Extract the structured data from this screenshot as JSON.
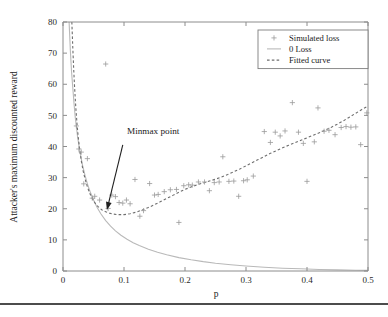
{
  "chart_data": {
    "type": "scatter",
    "title": "",
    "xlabel": "p",
    "ylabel": "Attacker's maximum discounted reward",
    "xlim": [
      0,
      0.5
    ],
    "ylim": [
      0,
      80
    ],
    "xticks": [
      "0",
      "0.1",
      "0.2",
      "0.3",
      "0.4",
      "0.5"
    ],
    "xtick_values": [
      0,
      0.1,
      0.2,
      0.3,
      0.4,
      0.5
    ],
    "yticks": [
      "0",
      "10",
      "20",
      "30",
      "40",
      "50",
      "60",
      "70",
      "80"
    ],
    "ytick_values": [
      0,
      10,
      20,
      30,
      40,
      50,
      60,
      70,
      80
    ],
    "grid": false,
    "legend_position": "top-right",
    "legend": [
      {
        "label": "Simulated loss",
        "marker": "plus",
        "style": "marker"
      },
      {
        "label": "0 Loss",
        "marker": "line",
        "style": "solid"
      },
      {
        "label": "Fitted curve",
        "marker": "line",
        "style": "dashed"
      }
    ],
    "annotations": [
      {
        "text": "Minmax point",
        "text_x": 0.105,
        "text_y": 44.0,
        "arrow_from_x": 0.098,
        "arrow_from_y": 40.5,
        "arrow_to_x": 0.072,
        "arrow_to_y": 19.6
      }
    ],
    "series": [
      {
        "name": "Simulated loss",
        "type": "scatter",
        "points": [
          [
            0.022,
            46.6
          ],
          [
            0.026,
            39.2
          ],
          [
            0.03,
            38.2
          ],
          [
            0.034,
            28.0
          ],
          [
            0.04,
            36.1
          ],
          [
            0.048,
            23.4
          ],
          [
            0.052,
            24.0
          ],
          [
            0.06,
            22.8
          ],
          [
            0.07,
            66.5
          ],
          [
            0.074,
            20.1
          ],
          [
            0.08,
            24.4
          ],
          [
            0.086,
            23.9
          ],
          [
            0.092,
            22.0
          ],
          [
            0.098,
            21.8
          ],
          [
            0.104,
            22.8
          ],
          [
            0.11,
            21.6
          ],
          [
            0.118,
            29.4
          ],
          [
            0.126,
            17.6
          ],
          [
            0.132,
            19.4
          ],
          [
            0.142,
            28.1
          ],
          [
            0.15,
            24.4
          ],
          [
            0.156,
            24.6
          ],
          [
            0.166,
            25.5
          ],
          [
            0.176,
            26.1
          ],
          [
            0.186,
            26.2
          ],
          [
            0.19,
            15.6
          ],
          [
            0.198,
            27.4
          ],
          [
            0.206,
            27.7
          ],
          [
            0.212,
            27.6
          ],
          [
            0.222,
            28.6
          ],
          [
            0.232,
            28.6
          ],
          [
            0.24,
            25.8
          ],
          [
            0.248,
            28.4
          ],
          [
            0.256,
            28.6
          ],
          [
            0.262,
            36.7
          ],
          [
            0.272,
            28.8
          ],
          [
            0.28,
            28.9
          ],
          [
            0.288,
            24.0
          ],
          [
            0.296,
            29.0
          ],
          [
            0.302,
            29.3
          ],
          [
            0.312,
            30.5
          ],
          [
            0.33,
            44.8
          ],
          [
            0.34,
            41.3
          ],
          [
            0.348,
            44.6
          ],
          [
            0.356,
            43.4
          ],
          [
            0.364,
            45.0
          ],
          [
            0.376,
            54.1
          ],
          [
            0.386,
            44.6
          ],
          [
            0.394,
            41.0
          ],
          [
            0.4,
            28.8
          ],
          [
            0.412,
            41.5
          ],
          [
            0.418,
            52.4
          ],
          [
            0.428,
            44.9
          ],
          [
            0.436,
            45.2
          ],
          [
            0.446,
            43.8
          ],
          [
            0.456,
            46.1
          ],
          [
            0.464,
            46.4
          ],
          [
            0.472,
            46.2
          ],
          [
            0.48,
            46.3
          ],
          [
            0.488,
            40.6
          ],
          [
            0.498,
            50.8
          ]
        ]
      },
      {
        "name": "0 Loss",
        "type": "line",
        "style": "solid",
        "points": [
          [
            0.01,
            80.0
          ],
          [
            0.012,
            71.0
          ],
          [
            0.014,
            64.0
          ],
          [
            0.016,
            59.0
          ],
          [
            0.018,
            54.0
          ],
          [
            0.02,
            49.5
          ],
          [
            0.024,
            43.0
          ],
          [
            0.028,
            38.0
          ],
          [
            0.032,
            34.0
          ],
          [
            0.036,
            30.8
          ],
          [
            0.04,
            28.0
          ],
          [
            0.045,
            25.2
          ],
          [
            0.05,
            22.8
          ],
          [
            0.056,
            20.4
          ],
          [
            0.062,
            18.4
          ],
          [
            0.07,
            16.2
          ],
          [
            0.078,
            14.4
          ],
          [
            0.086,
            12.9
          ],
          [
            0.095,
            11.5
          ],
          [
            0.105,
            10.2
          ],
          [
            0.115,
            9.1
          ],
          [
            0.125,
            8.2
          ],
          [
            0.14,
            7.0
          ],
          [
            0.155,
            6.0
          ],
          [
            0.17,
            5.2
          ],
          [
            0.19,
            4.3
          ],
          [
            0.21,
            3.6
          ],
          [
            0.23,
            3.0
          ],
          [
            0.25,
            2.5
          ],
          [
            0.275,
            2.0
          ],
          [
            0.3,
            1.6
          ],
          [
            0.33,
            1.2
          ],
          [
            0.36,
            0.9
          ],
          [
            0.39,
            0.7
          ],
          [
            0.42,
            0.5
          ],
          [
            0.45,
            0.35
          ],
          [
            0.48,
            0.25
          ],
          [
            0.5,
            0.2
          ]
        ]
      },
      {
        "name": "Fitted curve",
        "type": "line",
        "style": "dashed",
        "points": [
          [
            0.0145,
            80.0
          ],
          [
            0.016,
            72.0
          ],
          [
            0.0175,
            65.0
          ],
          [
            0.019,
            59.0
          ],
          [
            0.021,
            52.5
          ],
          [
            0.023,
            47.2
          ],
          [
            0.025,
            43.0
          ],
          [
            0.0275,
            38.8
          ],
          [
            0.03,
            35.4
          ],
          [
            0.033,
            32.2
          ],
          [
            0.036,
            29.7
          ],
          [
            0.04,
            27.0
          ],
          [
            0.044,
            24.9
          ],
          [
            0.048,
            23.3
          ],
          [
            0.053,
            21.7
          ],
          [
            0.058,
            20.6
          ],
          [
            0.064,
            19.6
          ],
          [
            0.07,
            19.0
          ],
          [
            0.076,
            18.6
          ],
          [
            0.082,
            18.3
          ],
          [
            0.09,
            18.1
          ],
          [
            0.1,
            18.1
          ],
          [
            0.11,
            18.4
          ],
          [
            0.12,
            18.9
          ],
          [
            0.13,
            19.6
          ],
          [
            0.14,
            20.4
          ],
          [
            0.15,
            21.3
          ],
          [
            0.16,
            22.3
          ],
          [
            0.17,
            23.3
          ],
          [
            0.18,
            24.3
          ],
          [
            0.19,
            25.3
          ],
          [
            0.2,
            26.2
          ],
          [
            0.21,
            27.0
          ],
          [
            0.22,
            27.7
          ],
          [
            0.23,
            28.3
          ],
          [
            0.24,
            28.9
          ],
          [
            0.25,
            29.5
          ],
          [
            0.26,
            30.2
          ],
          [
            0.27,
            31.0
          ],
          [
            0.28,
            31.9
          ],
          [
            0.29,
            32.8
          ],
          [
            0.3,
            33.8
          ],
          [
            0.31,
            34.8
          ],
          [
            0.32,
            35.8
          ],
          [
            0.33,
            36.8
          ],
          [
            0.34,
            37.8
          ],
          [
            0.35,
            38.7
          ],
          [
            0.36,
            39.6
          ],
          [
            0.37,
            40.4
          ],
          [
            0.38,
            41.2
          ],
          [
            0.39,
            42.0
          ],
          [
            0.4,
            42.8
          ],
          [
            0.41,
            43.6
          ],
          [
            0.42,
            44.4
          ],
          [
            0.43,
            45.3
          ],
          [
            0.44,
            46.2
          ],
          [
            0.45,
            47.2
          ],
          [
            0.46,
            48.3
          ],
          [
            0.47,
            49.5
          ],
          [
            0.48,
            50.7
          ],
          [
            0.49,
            51.9
          ],
          [
            0.5,
            53.0
          ]
        ]
      }
    ]
  },
  "figure": {
    "footer_rule_visible": true
  }
}
